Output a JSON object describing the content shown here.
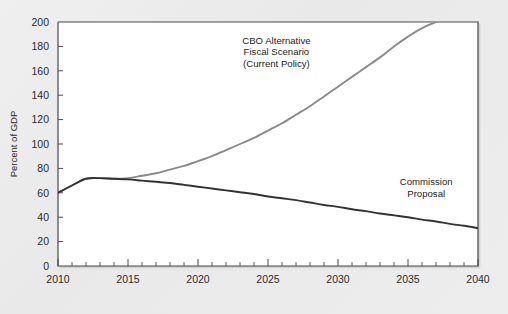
{
  "chart_data": {
    "type": "line",
    "title": "",
    "xlabel": "",
    "ylabel": "Percent of GDP",
    "xlim": [
      2010,
      2040
    ],
    "ylim": [
      0,
      200
    ],
    "grid": false,
    "legend_position": "inline-annotations",
    "x_ticks": [
      2010,
      2015,
      2020,
      2025,
      2030,
      2035,
      2040
    ],
    "x_tick_labels": [
      "2010",
      "2015",
      "2020",
      "2025",
      "2030",
      "2035",
      "2040"
    ],
    "x_minor_tick_step": 1,
    "y_ticks": [
      0,
      20,
      40,
      60,
      80,
      100,
      120,
      140,
      160,
      180,
      200
    ],
    "y_tick_labels": [
      "0",
      "20",
      "40",
      "60",
      "80",
      "100",
      "120",
      "140",
      "160",
      "180",
      "200"
    ],
    "series": [
      {
        "name": "CBO Alternative Fiscal Scenario (Current Policy)",
        "color": "#8a8a8a",
        "stroke_width": 1.9,
        "clipped_at_top": true,
        "x": [
          2010,
          2011,
          2012,
          2013,
          2014,
          2015,
          2016,
          2017,
          2018,
          2019,
          2020,
          2021,
          2022,
          2023,
          2024,
          2025,
          2026,
          2027,
          2028,
          2029,
          2030,
          2031,
          2032,
          2033,
          2034,
          2035,
          2036,
          2037
        ],
        "values": [
          60,
          66,
          71.5,
          72,
          71.5,
          72,
          74,
          76,
          79,
          82,
          86,
          90,
          95,
          100,
          105,
          111,
          117,
          124,
          131,
          139,
          147,
          155,
          163,
          171,
          180,
          188,
          195,
          200
        ]
      },
      {
        "name": "Commission Proposal",
        "color": "#333333",
        "stroke_width": 1.9,
        "clipped_at_top": false,
        "x": [
          2010,
          2011,
          2012,
          2013,
          2014,
          2015,
          2016,
          2017,
          2018,
          2019,
          2020,
          2021,
          2022,
          2023,
          2024,
          2025,
          2026,
          2027,
          2028,
          2029,
          2030,
          2031,
          2032,
          2033,
          2034,
          2035,
          2036,
          2037,
          2038,
          2039,
          2040
        ],
        "values": [
          60,
          66,
          71.5,
          72,
          71.5,
          71,
          70,
          69,
          68,
          66.5,
          65,
          63.5,
          62,
          60.5,
          59,
          57,
          55.5,
          54,
          52,
          50,
          48.5,
          46.5,
          45,
          43,
          41.5,
          40,
          38,
          36.5,
          34.5,
          33,
          31
        ]
      }
    ],
    "annotations": [
      {
        "name": "cbo-alternative-label",
        "lines": [
          "CBO Alternative",
          "Fiscal Scenario",
          "(Current Policy)"
        ],
        "x": 2025.6,
        "y": 182,
        "anchor": "middle"
      },
      {
        "name": "commission-proposal-label",
        "lines": [
          "Commission",
          "Proposal"
        ],
        "x": 2036.3,
        "y": 66,
        "anchor": "middle"
      }
    ]
  },
  "colors": {
    "background": "#ececec",
    "plot_background": "#ffffff",
    "axis": "#4a4a4a",
    "series_cbo": "#8a8a8a",
    "series_commission": "#333333",
    "text": "#2b2b2b"
  }
}
